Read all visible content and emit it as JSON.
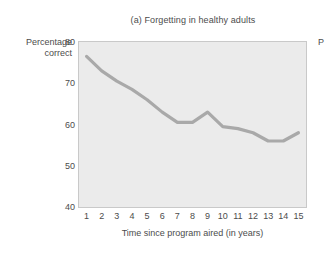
{
  "chart_data": {
    "type": "line",
    "title": "(a) Forgetting in healthy adults",
    "xlabel": "Time since program aired (in years)",
    "ylabel": "Percentage correct",
    "ylabel_lines": [
      "Percentage",
      "correct"
    ],
    "x": [
      1,
      2,
      3,
      4,
      5,
      6,
      7,
      8,
      9,
      10,
      11,
      12,
      13,
      14,
      15
    ],
    "values": [
      76.5,
      73.0,
      70.5,
      68.5,
      66.0,
      63.0,
      60.5,
      60.5,
      63.0,
      59.5,
      59.0,
      58.0,
      56.0,
      56.0,
      58.0
    ],
    "xticks": [
      "1",
      "2",
      "3",
      "4",
      "5",
      "6",
      "7",
      "8",
      "9",
      "10",
      "11",
      "12",
      "13",
      "14",
      "15"
    ],
    "yticks": [
      "80",
      "70",
      "60",
      "50",
      "40"
    ],
    "ytick_values": [
      80,
      70,
      60,
      50,
      40
    ],
    "xlim": [
      0.5,
      15.5
    ],
    "ylim": [
      40,
      80
    ],
    "grid": false,
    "legend": null,
    "series_color": "#a9a9a9",
    "plot_background": "#ebebeb",
    "axis_color": "#c9c9c9",
    "text_color": "#4c4c4c"
  },
  "edge": {
    "clipped_label": "P"
  }
}
